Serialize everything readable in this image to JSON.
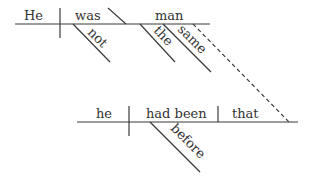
{
  "diagram": {
    "type": "sentence-diagram (Reed-Kellogg)",
    "main_clause": {
      "subject": "He",
      "verb": "was",
      "predicate_nominative": "man",
      "verb_modifiers": [
        "not"
      ],
      "noun_modifiers": [
        "the",
        "same"
      ]
    },
    "subordinate_clause": {
      "subject": "he",
      "verb": "had been",
      "complement": "that",
      "verb_modifiers": [
        "before"
      ]
    },
    "connector": "dashed line from 'same'/'man' region to 'that'"
  },
  "colors": {
    "line": "#3a3a3a",
    "text": "#333333",
    "background": "#ffffff"
  }
}
